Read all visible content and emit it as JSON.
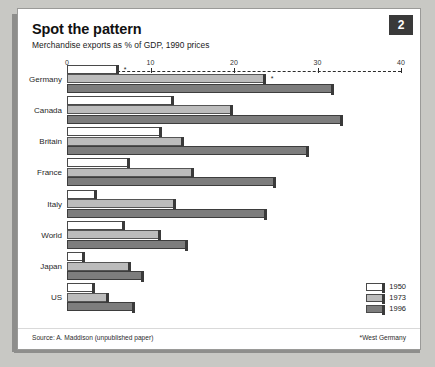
{
  "badge": {
    "label": "2"
  },
  "header": {
    "title": "Spot the pattern",
    "subtitle": "Merchandise exports as % of GDP, 1990 prices"
  },
  "footer": {
    "source": "Source: A. Maddison (unpublished paper)",
    "note": "*West Germany"
  },
  "legend": {
    "position": "bottom-right",
    "entries": [
      {
        "label": "1950",
        "color": "#ffffff"
      },
      {
        "label": "1973",
        "color": "#bcbcbc"
      },
      {
        "label": "1996",
        "color": "#7d7d7d"
      }
    ]
  },
  "chart_data": {
    "type": "bar",
    "orientation": "horizontal",
    "title": "Spot the pattern",
    "subtitle": "Merchandise exports as % of GDP, 1990 prices",
    "xlabel": "",
    "ylabel": "",
    "xlim": [
      0,
      40
    ],
    "xticks": [
      0,
      10,
      20,
      30,
      40
    ],
    "xticklabels": [
      "0",
      "10",
      "20",
      "30",
      "40"
    ],
    "grid": false,
    "axis_position": "top",
    "categories": [
      "Germany",
      "Canada",
      "Britain",
      "France",
      "Italy",
      "World",
      "Japan",
      "US"
    ],
    "category_notes": {
      "Germany": "*"
    },
    "series": [
      {
        "name": "1950",
        "color": "#ffffff",
        "values": [
          6.2,
          12.8,
          11.4,
          7.6,
          3.6,
          7.0,
          2.2,
          3.3
        ]
      },
      {
        "name": "1973",
        "color": "#bcbcbc",
        "values": [
          23.8,
          19.9,
          14.0,
          15.2,
          13.0,
          11.2,
          7.7,
          5.0
        ]
      },
      {
        "name": "1996",
        "color": "#7d7d7d",
        "values": [
          32.0,
          33.0,
          29.0,
          25.0,
          24.0,
          14.5,
          9.2,
          8.2
        ]
      }
    ]
  }
}
